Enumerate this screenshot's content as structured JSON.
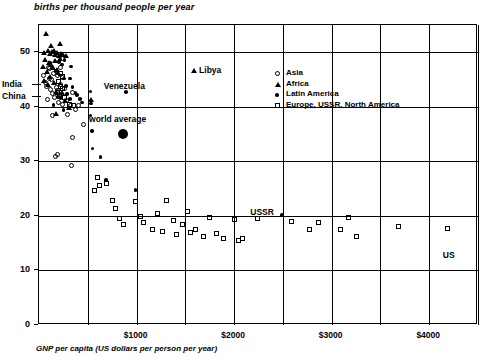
{
  "chart_data": {
    "type": "scatter",
    "title": "births per thousand people per year",
    "ylabel": "births per thousand people per year",
    "xlabel": "GNP per capita (US dollars per person per year)",
    "xlim": [
      0,
      4500
    ],
    "ylim": [
      0,
      55
    ],
    "grid": true,
    "x_major_ticks": [
      1000,
      2000,
      3000,
      4000
    ],
    "x_tick_labels": [
      "$1000",
      "$2000",
      "$3000",
      "$4000"
    ],
    "x_minor_gridlines": [
      500,
      1500,
      2500,
      3500,
      4500
    ],
    "y_ticks": [
      0,
      10,
      20,
      30,
      40,
      50
    ],
    "y_tick_labels": [
      "0",
      "10",
      "20",
      "30",
      "40",
      "50"
    ],
    "legend_position": "upper right inside",
    "legend": [
      {
        "marker": "open-circle",
        "label": "Asia"
      },
      {
        "marker": "triangle",
        "label": "Africa"
      },
      {
        "marker": "filled-dot",
        "label": "Latin America"
      },
      {
        "marker": "open-square",
        "label": "Europe, USSR, North America"
      }
    ],
    "annotations": [
      {
        "text": "India",
        "x": 100,
        "y": 44,
        "anchor": "left-arrow"
      },
      {
        "text": "China",
        "x": 100,
        "y": 41.8,
        "anchor": "left-arrow"
      },
      {
        "text": "Venezuela",
        "x": 900,
        "y": 42.5,
        "anchor": "above"
      },
      {
        "text": "Libya",
        "x": 1600,
        "y": 46.5,
        "anchor": "right"
      },
      {
        "text": "world average",
        "x": 850,
        "y": 36.5,
        "anchor": "above"
      },
      {
        "text": "USSR",
        "x": 2430,
        "y": 20.5,
        "anchor": "left"
      },
      {
        "text": "US",
        "x": 4200,
        "y": 14.5,
        "anchor": "below"
      }
    ],
    "series": [
      {
        "name": "Asia",
        "marker": "open-circle",
        "points": [
          [
            60,
            45.5
          ],
          [
            75,
            44.2
          ],
          [
            90,
            43.6
          ],
          [
            110,
            47.0
          ],
          [
            115,
            45.0
          ],
          [
            130,
            43.0
          ],
          [
            140,
            44.8
          ],
          [
            150,
            42.2
          ],
          [
            160,
            46.0
          ],
          [
            170,
            41.5
          ],
          [
            185,
            43.4
          ],
          [
            195,
            45.6
          ],
          [
            205,
            42.8
          ],
          [
            215,
            40.6
          ],
          [
            230,
            44.0
          ],
          [
            240,
            42.0
          ],
          [
            255,
            40.2
          ],
          [
            275,
            43.2
          ],
          [
            290,
            41.0
          ],
          [
            300,
            38.4
          ],
          [
            330,
            40.0
          ],
          [
            350,
            42.4
          ],
          [
            380,
            39.4
          ],
          [
            420,
            40.0
          ],
          [
            150,
            38.2
          ],
          [
            470,
            36.6
          ],
          [
            175,
            30.8
          ],
          [
            205,
            31.0
          ],
          [
            355,
            34.2
          ],
          [
            340,
            29.0
          ],
          [
            120,
            46.8
          ],
          [
            95,
            41.2
          ],
          [
            255,
            45.2
          ],
          [
            230,
            47.0
          ]
        ]
      },
      {
        "name": "Africa",
        "marker": "triangle",
        "points": [
          [
            80,
            53.2
          ],
          [
            130,
            51.0
          ],
          [
            225,
            51.4
          ],
          [
            60,
            49.8
          ],
          [
            100,
            50.2
          ],
          [
            120,
            49.6
          ],
          [
            145,
            49.9
          ],
          [
            165,
            50.1
          ],
          [
            180,
            49.4
          ],
          [
            200,
            49.8
          ],
          [
            215,
            49.2
          ],
          [
            240,
            49.6
          ],
          [
            260,
            49.4
          ],
          [
            285,
            49.2
          ],
          [
            70,
            48.4
          ],
          [
            110,
            48.0
          ],
          [
            135,
            47.6
          ],
          [
            155,
            47.0
          ],
          [
            175,
            48.2
          ],
          [
            195,
            46.6
          ],
          [
            90,
            46.2
          ],
          [
            125,
            45.4
          ],
          [
            210,
            46.0
          ],
          [
            65,
            44.6
          ],
          [
            105,
            43.8
          ],
          [
            160,
            44.2
          ],
          [
            185,
            42.6
          ],
          [
            250,
            42.4
          ],
          [
            275,
            41.0
          ],
          [
            320,
            39.6
          ],
          [
            190,
            38.6
          ],
          [
            540,
            41.2
          ],
          [
            1600,
            46.5
          ],
          [
            230,
            48.6
          ],
          [
            50,
            47.2
          ]
        ]
      },
      {
        "name": "Latin America",
        "marker": "filled-dot",
        "points": [
          [
            215,
            48.0
          ],
          [
            245,
            47.6
          ],
          [
            180,
            46.4
          ],
          [
            265,
            45.0
          ],
          [
            330,
            45.0
          ],
          [
            290,
            43.6
          ],
          [
            355,
            43.4
          ],
          [
            300,
            42.2
          ],
          [
            385,
            42.4
          ],
          [
            400,
            42.0
          ],
          [
            205,
            41.6
          ],
          [
            230,
            41.4
          ],
          [
            330,
            41.2
          ],
          [
            430,
            41.2
          ],
          [
            450,
            40.6
          ],
          [
            160,
            40.2
          ],
          [
            260,
            39.2
          ],
          [
            540,
            42.6
          ],
          [
            545,
            40.4
          ],
          [
            540,
            38.2
          ],
          [
            555,
            35.4
          ],
          [
            560,
            32.2
          ],
          [
            900,
            42.5
          ],
          [
            640,
            30.6
          ],
          [
            700,
            26.4
          ],
          [
            1000,
            24.6
          ],
          [
            2500,
            20.0
          ],
          [
            130,
            47.8
          ],
          [
            270,
            48.4
          ],
          [
            340,
            47.2
          ]
        ]
      },
      {
        "name": "Europe, USSR, North America",
        "marker": "open-square",
        "points": [
          [
            230,
            46.0
          ],
          [
            250,
            45.4
          ],
          [
            215,
            44.4
          ],
          [
            235,
            43.6
          ],
          [
            255,
            43.2
          ],
          [
            200,
            42.4
          ],
          [
            225,
            41.8
          ],
          [
            275,
            41.6
          ],
          [
            320,
            40.2
          ],
          [
            360,
            40.0
          ],
          [
            610,
            26.8
          ],
          [
            630,
            25.4
          ],
          [
            700,
            25.8
          ],
          [
            760,
            22.6
          ],
          [
            790,
            21.2
          ],
          [
            840,
            19.4
          ],
          [
            880,
            18.2
          ],
          [
            1000,
            22.4
          ],
          [
            1050,
            19.8
          ],
          [
            1080,
            18.6
          ],
          [
            1170,
            17.4
          ],
          [
            1230,
            20.2
          ],
          [
            1280,
            17.0
          ],
          [
            1320,
            22.6
          ],
          [
            1390,
            19.0
          ],
          [
            1420,
            16.4
          ],
          [
            1480,
            18.2
          ],
          [
            1530,
            20.6
          ],
          [
            1560,
            16.8
          ],
          [
            1610,
            17.4
          ],
          [
            1700,
            16.0
          ],
          [
            1760,
            19.6
          ],
          [
            1830,
            16.6
          ],
          [
            1900,
            15.6
          ],
          [
            2010,
            19.2
          ],
          [
            2060,
            15.4
          ],
          [
            2100,
            15.6
          ],
          [
            2250,
            19.4
          ],
          [
            2600,
            18.8
          ],
          [
            2780,
            17.4
          ],
          [
            2880,
            18.6
          ],
          [
            3100,
            17.4
          ],
          [
            3180,
            19.6
          ],
          [
            3260,
            16.0
          ],
          [
            3700,
            17.8
          ],
          [
            4200,
            17.6
          ],
          [
            580,
            24.4
          ]
        ]
      },
      {
        "name": "world average",
        "marker": "big-filled-dot",
        "points": [
          [
            870,
            34.8
          ]
        ]
      }
    ]
  }
}
